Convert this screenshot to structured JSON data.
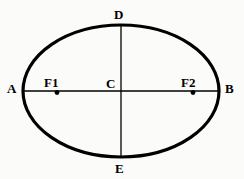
{
  "figure": {
    "type": "geometry-diagram",
    "background_color": "#fbfbf9",
    "stroke_color": "#000000",
    "canvas": {
      "width": 244,
      "height": 179
    }
  },
  "ellipse": {
    "center_x": 121,
    "center_y": 91,
    "radius_x": 98,
    "radius_y": 66,
    "stroke_width": 3.2
  },
  "axes": {
    "major": {
      "name": "major-axis",
      "x1": 23,
      "y1": 91,
      "x2": 219,
      "y2": 91,
      "stroke_width": 1.3
    },
    "minor": {
      "name": "minor-axis",
      "x1": 121,
      "y1": 25,
      "x2": 121,
      "y2": 157,
      "stroke_width": 1.3
    }
  },
  "foci": [
    {
      "id": "F1",
      "label": "F1",
      "x": 57,
      "y": 92,
      "dot_radius": 2.4
    },
    {
      "id": "F2",
      "label": "F2",
      "x": 193,
      "y": 92,
      "dot_radius": 2.4
    }
  ],
  "labels": {
    "A": "A",
    "B": "B",
    "C": "C",
    "D": "D",
    "E": "E",
    "F1": "F1",
    "F2": "F2"
  },
  "points": [
    {
      "id": "A",
      "label": "A",
      "role": "left-vertex",
      "x": 23,
      "y": 91
    },
    {
      "id": "B",
      "label": "B",
      "role": "right-vertex",
      "x": 219,
      "y": 91
    },
    {
      "id": "C",
      "label": "C",
      "role": "center",
      "x": 121,
      "y": 91
    },
    {
      "id": "D",
      "label": "D",
      "role": "top-vertex",
      "x": 121,
      "y": 25
    },
    {
      "id": "E",
      "label": "E",
      "role": "bottom-vertex",
      "x": 121,
      "y": 157
    },
    {
      "id": "F1",
      "label": "F1",
      "role": "focus-left",
      "x": 57,
      "y": 92
    },
    {
      "id": "F2",
      "label": "F2",
      "role": "focus-right",
      "x": 193,
      "y": 92
    }
  ]
}
